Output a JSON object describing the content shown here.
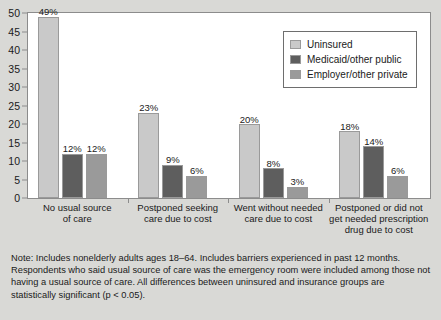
{
  "chart_data": {
    "type": "bar",
    "title": "",
    "xlabel": "",
    "ylabel": "",
    "ylim": [
      0,
      50
    ],
    "yticks": [
      0,
      5,
      10,
      15,
      20,
      25,
      30,
      35,
      40,
      45,
      50
    ],
    "ytick_labels": [
      "0",
      "5",
      "10",
      "15",
      "20",
      "25",
      "30",
      "35",
      "40",
      "45",
      "50"
    ],
    "grid": false,
    "legend_position": "top-right",
    "categories": [
      "No usual source\nof care",
      "Postponed seeking\ncare due to cost",
      "Went without needed\ncare due to cost",
      "Postponed or did not\nget needed prescription\ndrug due to cost"
    ],
    "category_lines": [
      [
        "No usual source",
        "of care"
      ],
      [
        "Postponed seeking",
        "care due to cost"
      ],
      [
        "Went without needed",
        "care due to cost"
      ],
      [
        "Postponed or did not",
        "get needed prescription",
        "drug due to cost"
      ]
    ],
    "series": [
      {
        "name": "Uninsured",
        "color": "#c9c9c9",
        "values": [
          49,
          23,
          20,
          18
        ],
        "labels": [
          "49%",
          "23%",
          "20%",
          "18%"
        ]
      },
      {
        "name": "Medicaid/other public",
        "color": "#5e5e5e",
        "values": [
          12,
          9,
          8,
          14
        ],
        "labels": [
          "12%",
          "9%",
          "8%",
          "14%"
        ]
      },
      {
        "name": "Employer/other private",
        "color": "#9a9a9a",
        "values": [
          12,
          6,
          3,
          6
        ],
        "labels": [
          "12%",
          "6%",
          "3%",
          "6%"
        ]
      }
    ]
  },
  "legend": {
    "items": [
      {
        "label": "Uninsured"
      },
      {
        "label": "Medicaid/other public"
      },
      {
        "label": "Employer/other private"
      }
    ]
  },
  "note": {
    "text": "Note: Includes nonelderly adults ages 18–64. Includes barriers experienced in past 12 months. Respondents who said usual source of care was the emergency room were included among those not having a usual source of care. All differences between uninsured and insurance groups are statistically significant (p < 0.05)."
  },
  "colors": {
    "figure_background": "#d9d9d6",
    "plot_background": "#ffffff",
    "axis": "#8c8c8c",
    "text": "#1a1a1a"
  }
}
